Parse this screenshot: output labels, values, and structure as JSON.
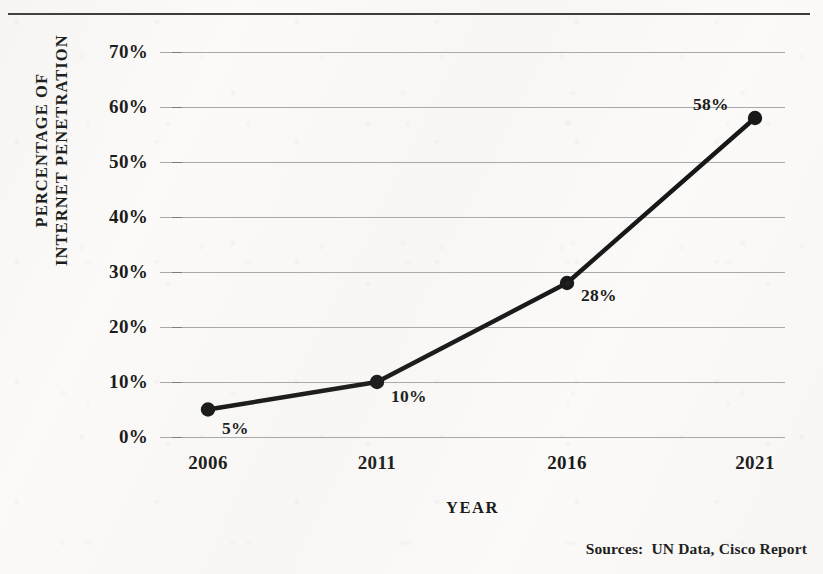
{
  "figure": {
    "sources_note": "Sources:  UN Data, Cisco Report"
  },
  "chart_data": {
    "type": "line",
    "title": "",
    "xlabel": "YEAR",
    "ylabel": "PERCENTAGE OF INTERNET PENETRATION",
    "ylabel_lines": [
      "PERCENTAGE OF",
      "INTERNET PENETRATION"
    ],
    "categories": [
      "2006",
      "2011",
      "2016",
      "2021"
    ],
    "x": [
      2006,
      2011,
      2016,
      2021
    ],
    "values": [
      5,
      10,
      28,
      58
    ],
    "point_labels": [
      "5%",
      "10%",
      "28%",
      "58%"
    ],
    "ylim": [
      0,
      70
    ],
    "ytick_labels": [
      "0%",
      "10%",
      "20%",
      "30%",
      "40%",
      "50%",
      "60%",
      "70%"
    ],
    "ytick_values": [
      0,
      10,
      20,
      30,
      40,
      50,
      60,
      70
    ],
    "grid": true,
    "legend": "none",
    "series_color": "#171717",
    "grid_color": "#a9a9a9",
    "background_color": "#fbfaf8",
    "marker": "circle",
    "line_width": 4
  }
}
